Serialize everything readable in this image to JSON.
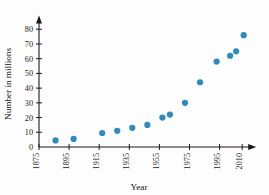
{
  "chart_data": {
    "type": "scatter",
    "title": "",
    "xlabel": "Year",
    "ylabel": "Number in millions",
    "xlim": [
      1875,
      2015
    ],
    "ylim": [
      0,
      85
    ],
    "grid": false,
    "legend": null,
    "marker_color": "#2e8bc0",
    "axis_color": "#1a1a1a",
    "x_ticks": [
      1875,
      1895,
      1915,
      1935,
      1955,
      1975,
      1995,
      2010
    ],
    "x_tick_labels": [
      "1875",
      "1895",
      "1915",
      "1935",
      "1955",
      "1975",
      "1995",
      "2010"
    ],
    "y_ticks": [
      0,
      10,
      20,
      30,
      40,
      50,
      60,
      70,
      80
    ],
    "y_tick_labels": [
      "0",
      "10",
      "20",
      "30",
      "40",
      "50",
      "60",
      "70",
      "80"
    ],
    "x": [
      1886,
      1898,
      1917,
      1927,
      1937,
      1947,
      1957,
      1962,
      1972,
      1982,
      1993,
      2002,
      2006,
      2011
    ],
    "y": [
      4.5,
      5.5,
      9.5,
      11,
      13,
      15,
      20,
      22,
      30,
      44,
      58,
      62,
      65,
      76
    ],
    "points": [
      {
        "x": 1886,
        "y": 4.5
      },
      {
        "x": 1898,
        "y": 5.5
      },
      {
        "x": 1917,
        "y": 9.5
      },
      {
        "x": 1927,
        "y": 11
      },
      {
        "x": 1937,
        "y": 13
      },
      {
        "x": 1947,
        "y": 15
      },
      {
        "x": 1957,
        "y": 20
      },
      {
        "x": 1962,
        "y": 22
      },
      {
        "x": 1972,
        "y": 30
      },
      {
        "x": 1982,
        "y": 44
      },
      {
        "x": 1993,
        "y": 58
      },
      {
        "x": 2002,
        "y": 62
      },
      {
        "x": 2006,
        "y": 65
      },
      {
        "x": 2011,
        "y": 76
      }
    ]
  }
}
